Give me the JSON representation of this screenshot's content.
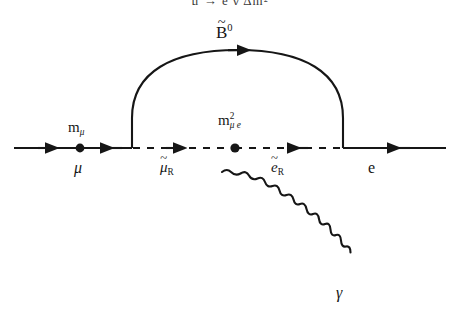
{
  "figure": {
    "kind": "feynman-diagram",
    "process": "mu-to-e-gamma",
    "background_color": "#ffffff",
    "line_color": "#161616",
    "cropped_caption_text": "μ → e γ Δm²"
  },
  "labels": {
    "bino": {
      "base": "B",
      "tilde": "~",
      "sup": "0"
    },
    "muon_mass_insertion": {
      "base": "m",
      "sub": "μ"
    },
    "incoming_muon": "μ",
    "slepton_mass_insertion": {
      "base": "m",
      "sup": "2",
      "sub": "μ e"
    },
    "smuon_right": {
      "base": "μ",
      "tilde": "~",
      "sub": "R"
    },
    "selectron_right": {
      "base": "e",
      "tilde": "~",
      "sub": "R"
    },
    "outgoing_electron": "e",
    "photon": "γ"
  },
  "geometry": {
    "fermion_line_y": 148,
    "arc_left_x": 132,
    "arc_right_x": 343,
    "arc_apex_y": 55,
    "mass_dot_left_x": 80,
    "mass_dot_center_x": 235,
    "line_start_x": 14,
    "line_end_x": 446,
    "photon_start": [
      222,
      172
    ],
    "photon_end": [
      331,
      290
    ]
  },
  "arrows": {
    "incoming_muon_direction": "right",
    "muon_to_vertex_direction": "left",
    "smuon_direction": "right",
    "selectron_direction": "left",
    "outgoing_electron_direction": "left",
    "bino_direction": "right"
  }
}
